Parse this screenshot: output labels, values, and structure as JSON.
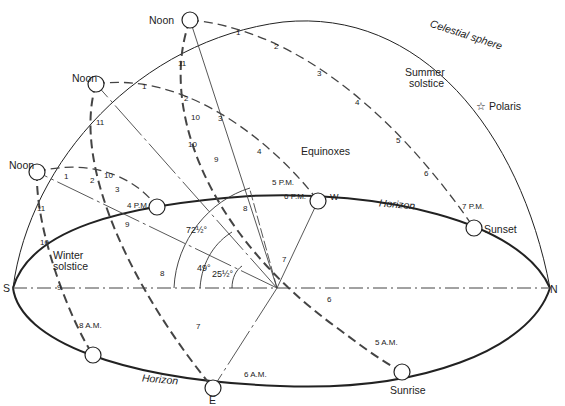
{
  "diagram": {
    "colors": {
      "ink": "#222222",
      "background": "#ffffff"
    },
    "labels": {
      "celestial_sphere": "Celestial sphere",
      "summer_solstice_1": "Summer",
      "summer_solstice_2": "solstice",
      "winter_solstice_1": "Winter",
      "winter_solstice_2": "solstice",
      "equinoxes": "Equinoxes",
      "polaris": "Polaris",
      "polaris_icon": "☆",
      "horizon_back": "Horizon",
      "horizon_front": "Horizon",
      "sunset": "Sunset",
      "sunrise": "Sunrise",
      "noon_top": "Noon",
      "noon_mid": "Noon",
      "noon_low": "Noon",
      "south": "S",
      "north": "N",
      "east": "E",
      "west": "W"
    },
    "angles": {
      "summer": "72½°",
      "equinox": "49°",
      "winter": "25½°"
    },
    "summer_path": {
      "hours_pm": [
        "1",
        "2",
        "3",
        "4",
        "5",
        "6",
        "7 P.M."
      ],
      "hours_am": [
        "11",
        "10",
        "9",
        "8",
        "7",
        "6",
        "5 A.M."
      ]
    },
    "equinox_path": {
      "hours_pm": [
        "1",
        "2",
        "3",
        "4",
        "5 P.M.",
        "6 P.M."
      ],
      "hours_am": [
        "11",
        "10",
        "9",
        "8",
        "7",
        "6 A.M."
      ]
    },
    "winter_path": {
      "hours_pm": [
        "1",
        "2",
        "3",
        "4 P.M."
      ],
      "hours_am": [
        "11",
        "10",
        "9",
        "8 A.M."
      ],
      "extra": "10"
    }
  }
}
